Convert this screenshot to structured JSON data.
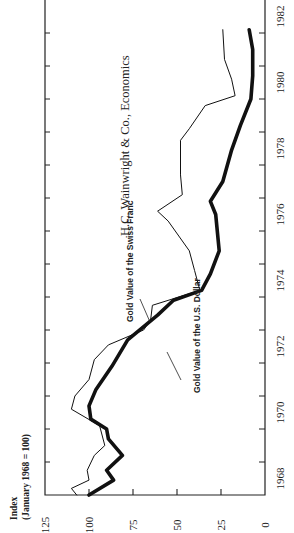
{
  "chart_data": {
    "type": "line",
    "orientation_note": "rotated 90 degrees counter-clockwise",
    "title": "",
    "credit": "H.C. Wainwright & Co., Economics",
    "xlabel": "",
    "ylabel": "Index (January 1968 = 100)",
    "ylabel_line1": "Index",
    "ylabel_line2": "(January 1968  =  100)",
    "xlim": [
      1968,
      1983
    ],
    "ylim": [
      0,
      125
    ],
    "x_ticks": [
      1968,
      1970,
      1972,
      1974,
      1976,
      1978,
      1980,
      1982
    ],
    "y_ticks": [
      0,
      25,
      50,
      75,
      100,
      125
    ],
    "grid": false,
    "series": [
      {
        "name": "Gold Value of the U.S. Dollar",
        "style": "thick",
        "x": [
          1968.0,
          1968.45,
          1968.75,
          1969.2,
          1969.7,
          1970.0,
          1970.3,
          1970.7,
          1971.2,
          1971.9,
          1972.7,
          1973.45,
          1973.9,
          1974.2,
          1974.7,
          1975.4,
          1976.5,
          1976.9,
          1977.5,
          1978.45,
          1979.2,
          1980.0,
          1980.7,
          1981.5,
          1982.1
        ],
        "values": [
          100,
          86,
          90,
          81,
          89,
          90,
          99,
          100,
          96,
          87,
          78,
          61,
          52,
          36,
          31,
          26,
          28,
          31,
          24,
          19,
          14,
          8,
          7,
          7,
          9
        ]
      },
      {
        "name": "Gold Value of the Swiss Franc",
        "style": "thin",
        "x": [
          1968.0,
          1968.2,
          1968.45,
          1968.75,
          1969.2,
          1969.5,
          1970.1,
          1970.6,
          1971.0,
          1971.5,
          1972.1,
          1972.55,
          1973.0,
          1973.3,
          1973.75,
          1974.2,
          1974.8,
          1975.4,
          1976.3,
          1976.6,
          1977.1,
          1977.7,
          1978.75,
          1979.1,
          1979.8,
          1980.1,
          1980.6,
          1981.2,
          1982.1
        ],
        "values": [
          107,
          110,
          100,
          101,
          97,
          91,
          94,
          110,
          108,
          100,
          97,
          89,
          69,
          65,
          64,
          37,
          40,
          43,
          55,
          61,
          47,
          48,
          48,
          43,
          34,
          17,
          19,
          23,
          24
        ]
      }
    ],
    "annotations": [
      {
        "text": "Gold Value of the Swiss Franc",
        "target": "Gold Value of the Swiss Franc"
      },
      {
        "text": "Gold Value of the U.S. Dollar",
        "target": "Gold Value of the U.S. Dollar"
      }
    ],
    "layout": {
      "plot_left_px": 45,
      "plot_right_px": 265,
      "plot_top_px": 0,
      "plot_bottom_px": 495,
      "px_per_year": 33,
      "px_per_unit": 1.76
    }
  }
}
